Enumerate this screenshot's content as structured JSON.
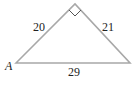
{
  "diagram": {
    "type": "right-triangle",
    "vertices": {
      "left": {
        "x": 16,
        "y": 63,
        "label": "A"
      },
      "apex": {
        "x": 75,
        "y": 4,
        "label": ""
      },
      "right": {
        "x": 130,
        "y": 63,
        "label": ""
      }
    },
    "sides": {
      "left_leg": "20",
      "right_leg": "21",
      "hypotenuse": "29"
    },
    "right_angle_at": "apex",
    "colors": {
      "line": "#a8a8a8",
      "text": "#222222",
      "background": "#ffffff"
    }
  }
}
